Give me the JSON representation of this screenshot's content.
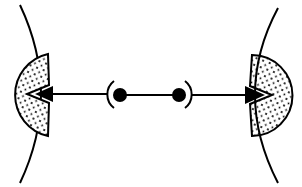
{
  "diagram": {
    "width": 302,
    "height": 187,
    "colors": {
      "background": "#ffffff",
      "stroke": "#000000",
      "stipple_fill": "#f2f2f2",
      "dot": "#000000"
    },
    "elements": [
      {
        "id": "left-membrane",
        "kind": "curve"
      },
      {
        "id": "left-receptor",
        "kind": "stippled-half-disc-with-notch"
      },
      {
        "id": "left-arrow",
        "kind": "arrow",
        "direction": "left"
      },
      {
        "id": "center-dumbbell",
        "kind": "two-dots-linked",
        "count": 2
      },
      {
        "id": "right-arrow",
        "kind": "arrow",
        "direction": "right"
      },
      {
        "id": "right-receptor",
        "kind": "stippled-half-disc-with-notch"
      },
      {
        "id": "right-membrane",
        "kind": "curve"
      }
    ]
  }
}
